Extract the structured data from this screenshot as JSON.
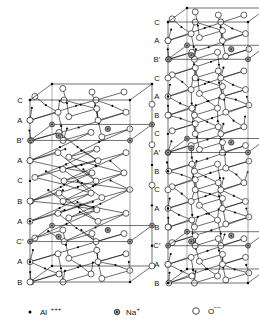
{
  "figure": {
    "kind": "crystal-structure-diagram",
    "background": "#ffffff",
    "ink": "#111111",
    "structures": [
      {
        "id": "left-cell",
        "name": "beta-alumina-unit-cell",
        "stacking_labels": [
          "C",
          "A",
          "B′",
          "A",
          "C",
          "B",
          "A",
          "C′",
          "A",
          "B"
        ],
        "mirror_planes": [
          "B′",
          "C′"
        ],
        "label_x": 20,
        "box": {
          "left": 30,
          "right": 130,
          "top": 100,
          "bottom": 282,
          "depth_dx": 22,
          "depth_dy": -16
        }
      },
      {
        "id": "right-cell",
        "name": "beta-double-prime-alumina-unit-cell",
        "stacking_labels": [
          "C",
          "A",
          "B′",
          "C",
          "A",
          "B",
          "C",
          "A′",
          "B",
          "C",
          "A",
          "B",
          "C′",
          "A",
          "B"
        ],
        "mirror_planes": [
          "B′",
          "A′",
          "C′"
        ],
        "label_x": 157,
        "box": {
          "left": 168,
          "right": 248,
          "top": 22,
          "bottom": 283,
          "depth_dx": 19,
          "depth_dy": -14
        }
      }
    ]
  },
  "legend": {
    "items": [
      {
        "glyph": "small-filled-dot",
        "symbol": "Al",
        "charge": "+++",
        "species": "aluminium-cation",
        "marker_x": 30,
        "marker_y": 312,
        "text_x": 40
      },
      {
        "glyph": "gray-filled-circle",
        "symbol": "Na",
        "charge": "+",
        "species": "sodium-cation",
        "marker_x": 117,
        "marker_y": 312,
        "text_x": 126
      },
      {
        "glyph": "open-circle",
        "symbol": "O",
        "charge": "−−",
        "species": "oxide-anion",
        "marker_x": 196,
        "marker_y": 311,
        "text_x": 208
      }
    ]
  },
  "colors": {
    "line": "#111111",
    "vertical_edge": "#8a8a8a",
    "na_fill": "#9a9a9a",
    "o_fill": "#ffffff",
    "al_fill": "#000000",
    "page": "#ffffff"
  },
  "chart_data": {
    "type": "scatter",
    "title": "",
    "xlabel": "",
    "ylabel": "",
    "note": "Two polyhedral unit-cell drawings of sodium beta-alumina; markers denote ion species.",
    "series": [
      {
        "name": "Al+++",
        "marker": "small filled dot"
      },
      {
        "name": "Na+",
        "marker": "gray filled circle"
      },
      {
        "name": "O--",
        "marker": "large open circle"
      }
    ]
  }
}
